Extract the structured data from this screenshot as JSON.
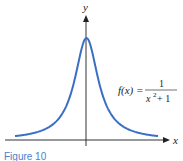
{
  "chart_data": {
    "type": "line",
    "title": "",
    "xlabel": "x",
    "ylabel": "y",
    "function_label": "f(x) = 1 / (x^2 + 1)",
    "series": [
      {
        "name": "f(x) = 1/(x^2+1)",
        "color": "#3a6fc4",
        "x": [
          -5,
          -4,
          -3,
          -2,
          -1.5,
          -1,
          -0.5,
          0,
          0.5,
          1,
          1.5,
          2,
          3,
          4,
          5
        ],
        "y": [
          0.038,
          0.059,
          0.1,
          0.2,
          0.308,
          0.5,
          0.8,
          1,
          0.8,
          0.5,
          0.308,
          0.2,
          0.1,
          0.059,
          0.038
        ]
      }
    ],
    "xlim": [
      -5,
      5
    ],
    "ylim": [
      0,
      1.2
    ],
    "grid": false,
    "legend": "none"
  },
  "labels": {
    "x_axis": "x",
    "y_axis": "y",
    "f_lhs": "f(x) =",
    "numerator": "1",
    "denominator_base": "x",
    "denominator_exp": "2",
    "denominator_rest": " + 1",
    "caption": "Figure 10"
  },
  "colors": {
    "curve": "#3a6fc4",
    "axis": "#333333"
  }
}
